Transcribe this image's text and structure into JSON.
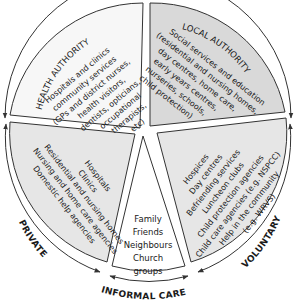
{
  "diagram": {
    "type": "circular-sector-diagram",
    "colors": {
      "health_authority_fill": "#f7f7f7",
      "local_authority_fill": "#d9d9d9",
      "private_fill": "#e6e6e6",
      "informal_fill": "#ffffff",
      "voluntary_fill": "#e6e6e6",
      "line": "#333333"
    },
    "segments": {
      "health_authority": {
        "title": "HEALTH AUTHORITY",
        "lines": [
          "Hospitals and clinics",
          "community services",
          "(GPs and district nurses,",
          "health visitors,",
          "dentists, opticians,",
          "occupational",
          "therapists,",
          "etc)"
        ]
      },
      "local_authority": {
        "title": "LOCAL AUTHORITY",
        "lines": [
          "Social services and education",
          "(residential and nursing homes,",
          "day centres, home care,",
          "early years centres,",
          "nurseries, schools,",
          "child protection)"
        ]
      },
      "private": {
        "lines": [
          "Hospitals",
          "Clinics",
          "Residential and nursing homes",
          "Nursing and home care agencies",
          "Domestic help agencies"
        ]
      },
      "informal": {
        "lines": [
          "Family",
          "Friends",
          "Neighbours",
          "Church",
          "groups"
        ]
      },
      "voluntary": {
        "lines": [
          "Hospices",
          "Day centres",
          "Befriending services",
          "Luncheon clubs",
          "Child protection agencies",
          "Child care agencies (e.g. NSPCC)",
          "Help in the community",
          "(e.g. WRVS)"
        ]
      }
    },
    "ring_labels": {
      "private": "PRIVATE",
      "informal": "INFORMAL CARE",
      "voluntary": "VOLUNTARY"
    }
  }
}
